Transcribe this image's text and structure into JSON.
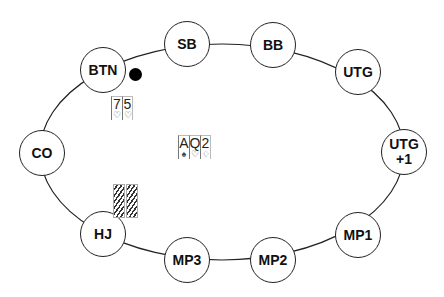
{
  "table": {
    "shape": "ellipse",
    "line_color": "#222222"
  },
  "seats": [
    {
      "id": "btn",
      "label": "BTN",
      "x": 103,
      "y": 70
    },
    {
      "id": "sb",
      "label": "SB",
      "x": 187,
      "y": 44
    },
    {
      "id": "bb",
      "label": "BB",
      "x": 273,
      "y": 45
    },
    {
      "id": "utg",
      "label": "UTG",
      "x": 358,
      "y": 72
    },
    {
      "id": "utg1",
      "label": "UTG\n+1",
      "x": 404,
      "y": 152
    },
    {
      "id": "mp1",
      "label": "MP1",
      "x": 358,
      "y": 235
    },
    {
      "id": "mp2",
      "label": "MP2",
      "x": 273,
      "y": 260
    },
    {
      "id": "mp3",
      "label": "MP3",
      "x": 187,
      "y": 260
    },
    {
      "id": "hj",
      "label": "HJ",
      "x": 103,
      "y": 234
    },
    {
      "id": "co",
      "label": "CO",
      "x": 42,
      "y": 153
    }
  ],
  "dealer_button": {
    "seat": "BTN",
    "color": "#000000"
  },
  "hands": {
    "btn": [
      {
        "rank": "7",
        "suit": "♡"
      },
      {
        "rank": "5",
        "suit": "♡"
      }
    ],
    "board": [
      {
        "rank": "A",
        "suit": "♠"
      },
      {
        "rank": "Q",
        "suit": "♡"
      },
      {
        "rank": "2",
        "suit": "♢"
      }
    ],
    "hj": {
      "face_down": 2
    }
  },
  "labels": {
    "btn": "BTN",
    "sb": "SB",
    "bb": "BB",
    "utg": "UTG",
    "utg1_line1": "UTG",
    "utg1_line2": "+1",
    "mp1": "MP1",
    "mp2": "MP2",
    "mp3": "MP3",
    "hj": "HJ",
    "co": "CO"
  }
}
